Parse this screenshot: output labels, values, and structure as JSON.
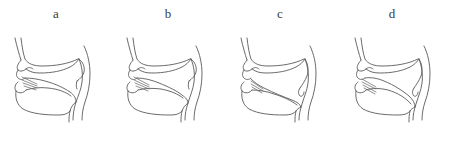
{
  "figure": {
    "background_color": "#ffffff",
    "line_color": "#5a5a5a",
    "panel_count": 4
  },
  "panels": [
    {
      "label": "a",
      "name": "panel-a",
      "articulation": "tongue tip raised to alveolar ridge with airflow hatching",
      "velum": "raised",
      "parts": [
        "nose",
        "upper-lip",
        "lower-lip",
        "teeth",
        "hard-palate",
        "velum",
        "uvula",
        "tongue",
        "pharyngeal-wall",
        "jaw",
        "neck",
        "airflow-hatching"
      ]
    },
    {
      "label": "b",
      "name": "panel-b",
      "articulation": "tongue tip raised to alveolar ridge with airflow hatching",
      "velum": "raised",
      "parts": [
        "nose",
        "upper-lip",
        "lower-lip",
        "teeth",
        "hard-palate",
        "velum",
        "uvula",
        "tongue",
        "pharyngeal-wall",
        "jaw",
        "neck",
        "airflow-hatching"
      ]
    },
    {
      "label": "c",
      "name": "panel-c",
      "articulation": "tongue body lowered, tip near teeth with airflow hatching",
      "velum": "lowered",
      "parts": [
        "nose",
        "upper-lip",
        "lower-lip",
        "teeth",
        "hard-palate",
        "velum",
        "uvula",
        "tongue",
        "pharyngeal-wall",
        "jaw",
        "neck",
        "airflow-hatching"
      ]
    },
    {
      "label": "d",
      "name": "panel-d",
      "articulation": "tongue bunched forward, tip near teeth with airflow hatching",
      "velum": "lowered",
      "parts": [
        "nose",
        "upper-lip",
        "lower-lip",
        "teeth",
        "hard-palate",
        "velum",
        "uvula",
        "tongue",
        "pharyngeal-wall",
        "jaw",
        "neck",
        "airflow-hatching"
      ]
    }
  ]
}
